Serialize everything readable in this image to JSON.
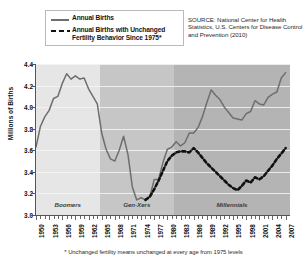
{
  "legend": {
    "items": [
      {
        "key": "solid-line",
        "label": "Annual Births"
      },
      {
        "key": "dashed-line",
        "label": "Annual Births with Unchanged Fertility Behavior Since 1975*"
      }
    ]
  },
  "source_note": "SOURCE: National Center for Health Statistics, U.S. Centers for Disease Control and Prevention (2010)",
  "footnote": "* Unchanged fertility means unchanged at every age from 1975 levels",
  "colors": {
    "solid_line": "#6e6e6e",
    "dashed_line": "#111111",
    "band_boomers": "#e6e6e6",
    "band_genx": "#c6c6c6",
    "band_millennials": "#b4b4b4",
    "axis": "#555555",
    "background": "#ffffff"
  },
  "bands": [
    {
      "name": "Boomers",
      "start": 1950,
      "end": 1964.5
    },
    {
      "name": "Gen-Xers",
      "start": 1964.5,
      "end": 1981.5
    },
    {
      "name": "Millennials",
      "start": 1981.5,
      "end": 2008
    }
  ],
  "chart_data": {
    "type": "line",
    "title": "",
    "xlabel": "",
    "ylabel": "Millions of Births",
    "xlim": [
      1950,
      2008
    ],
    "ylim": [
      3.0,
      4.4
    ],
    "yticks": [
      3.0,
      3.2,
      3.4,
      3.6,
      3.8,
      4.0,
      4.2,
      4.4
    ],
    "ytick_labels": [
      "3.0",
      "3.2",
      "3.4",
      "3.6",
      "3.8",
      "4.0",
      "4.2",
      "4.4"
    ],
    "xticks": [
      1950,
      1953,
      1956,
      1959,
      1962,
      1965,
      1968,
      1971,
      1974,
      1977,
      1980,
      1983,
      1986,
      1989,
      1992,
      1995,
      1998,
      2001,
      2004,
      2007
    ],
    "xtick_labels": [
      "1950",
      "1953",
      "1956",
      "1959",
      "1962",
      "1965",
      "1968",
      "1971",
      "1974",
      "1977",
      "1980",
      "1983",
      "1986",
      "1989",
      "1992",
      "1995",
      "1998",
      "2001",
      "2004",
      "2007"
    ],
    "grid": true,
    "legend_position": "top-left",
    "series": [
      {
        "name": "Annual Births",
        "style": "solid",
        "color": "#6e6e6e",
        "x": [
          1950,
          1951,
          1952,
          1953,
          1954,
          1955,
          1956,
          1957,
          1958,
          1959,
          1960,
          1961,
          1962,
          1963,
          1964,
          1965,
          1966,
          1967,
          1968,
          1969,
          1970,
          1971,
          1972,
          1973,
          1974,
          1975,
          1976,
          1977,
          1978,
          1979,
          1980,
          1981,
          1982,
          1983,
          1984,
          1985,
          1986,
          1987,
          1988,
          1989,
          1990,
          1991,
          1992,
          1993,
          1994,
          1995,
          1996,
          1997,
          1998,
          1999,
          2000,
          2001,
          2002,
          2003,
          2004,
          2005,
          2006,
          2007
        ],
        "values": [
          3.63,
          3.82,
          3.91,
          3.97,
          4.08,
          4.1,
          4.22,
          4.31,
          4.26,
          4.29,
          4.26,
          4.27,
          4.17,
          4.1,
          4.03,
          3.76,
          3.61,
          3.52,
          3.5,
          3.6,
          3.73,
          3.56,
          3.26,
          3.14,
          3.16,
          3.14,
          3.17,
          3.33,
          3.33,
          3.49,
          3.61,
          3.63,
          3.68,
          3.64,
          3.67,
          3.76,
          3.76,
          3.81,
          3.91,
          4.04,
          4.16,
          4.11,
          4.07,
          4.0,
          3.95,
          3.9,
          3.89,
          3.88,
          3.94,
          3.96,
          4.06,
          4.03,
          4.02,
          4.09,
          4.12,
          4.14,
          4.27,
          4.32
        ]
      },
      {
        "name": "Annual Births with Unchanged Fertility Behavior Since 1975*",
        "style": "dashed",
        "color": "#111111",
        "x": [
          1975,
          1976,
          1977,
          1978,
          1979,
          1980,
          1981,
          1982,
          1983,
          1984,
          1985,
          1986,
          1987,
          1988,
          1989,
          1990,
          1991,
          1992,
          1993,
          1994,
          1995,
          1996,
          1997,
          1998,
          1999,
          2000,
          2001,
          2002,
          2003,
          2004,
          2005,
          2006,
          2007
        ],
        "values": [
          3.14,
          3.17,
          3.24,
          3.32,
          3.41,
          3.5,
          3.55,
          3.58,
          3.59,
          3.59,
          3.58,
          3.62,
          3.58,
          3.53,
          3.48,
          3.44,
          3.4,
          3.36,
          3.32,
          3.28,
          3.25,
          3.23,
          3.27,
          3.32,
          3.3,
          3.35,
          3.33,
          3.36,
          3.41,
          3.46,
          3.52,
          3.57,
          3.62
        ]
      }
    ]
  }
}
